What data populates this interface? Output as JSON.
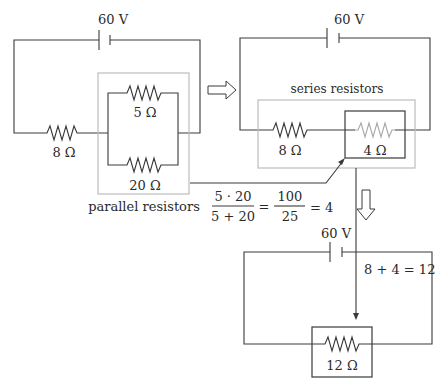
{
  "diagram": {
    "colors": {
      "wire": "#3a3a3a",
      "highlight_box": "#bdbdbd",
      "faded_resistor": "#a8a8a8"
    },
    "circuit1": {
      "battery_label": "60 V",
      "resistor_series_label": "8 Ω",
      "parallel_top_label": "5 Ω",
      "parallel_bottom_label": "20 Ω",
      "group_caption": "parallel resistors"
    },
    "circuit2": {
      "battery_label": "60 V",
      "group_caption": "series resistors",
      "resistor_a_label": "8 Ω",
      "resistor_b_label": "4 Ω"
    },
    "circuit3": {
      "battery_label": "60 V",
      "resistor_label": "12 Ω"
    },
    "formulas": {
      "parallel": {
        "num1": "5 · 20",
        "den1": "5 + 20",
        "eq1": "=",
        "num2": "100",
        "den2": "25",
        "result": "= 4"
      },
      "series": "8 + 4 = 12"
    },
    "arrows": [
      {
        "name": "right-transform-arrow",
        "direction": "right"
      },
      {
        "name": "down-transform-arrow",
        "direction": "down"
      }
    ]
  }
}
